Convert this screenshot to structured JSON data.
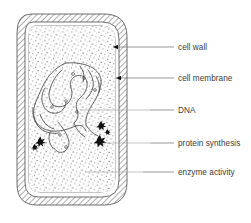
{
  "diagram": {
    "style": "black and white line drawing with hatched cell wall and stippled cytoplasm",
    "colors": {
      "line": "#4a4a4a",
      "text": "#3b3b3b",
      "leader": "#6e6e6e",
      "fill_dark": "#111111",
      "background": "#ffffff",
      "stipple": "#5a5a5a",
      "hatch": "#6a6a6a"
    },
    "labels": [
      {
        "id": "cell-wall",
        "text": "cell wall",
        "text_x": 178,
        "text_y": 50,
        "leader_x1": 158,
        "leader_x2": 174,
        "leader_y": 47,
        "pointer_x1": 113,
        "pointer_x2": 158,
        "pointer_y": 47,
        "has_arrow": true
      },
      {
        "id": "cell-membrane",
        "text": "cell membrane",
        "text_x": 178,
        "text_y": 81,
        "leader_x1": 158,
        "leader_x2": 174,
        "leader_y": 78,
        "pointer_x1": 116,
        "pointer_x2": 158,
        "pointer_y": 78,
        "has_arrow": true
      },
      {
        "id": "dna",
        "text": "DNA",
        "text_x": 178,
        "text_y": 113,
        "leader_x1": 150,
        "leader_x2": 174,
        "leader_y": 110,
        "pointer_x1": 80,
        "pointer_x2": 150,
        "pointer_y": 110,
        "has_arrow": false
      },
      {
        "id": "protein-synthesis",
        "text": "protein synthesis",
        "text_x": 178,
        "text_y": 146,
        "leader_x1": 150,
        "leader_x2": 174,
        "leader_y": 143,
        "pointer_x1": 104,
        "pointer_x2": 150,
        "pointer_y": 143,
        "has_arrow": false
      },
      {
        "id": "enzyme-activity",
        "text": "enzyme activity",
        "text_x": 178,
        "text_y": 175,
        "leader_x1": 143,
        "leader_x2": 174,
        "leader_y": 172,
        "pointer_x1": 85,
        "pointer_x2": 143,
        "pointer_y": 172,
        "has_arrow": false
      }
    ],
    "structures": [
      {
        "id": "cell-wall-band",
        "name": "cell wall",
        "description": "outer hatched band surrounding the cell"
      },
      {
        "id": "cell-membrane-band",
        "name": "cell membrane",
        "description": "thin line inside the cell wall"
      },
      {
        "id": "cytoplasm",
        "name": "cytoplasm",
        "description": "stippled interior region"
      },
      {
        "id": "nucleoid",
        "name": "DNA",
        "description": "tangled looped thread in the upper-left interior"
      },
      {
        "id": "ribosome-cluster-left",
        "name": "protein synthesis site",
        "description": "dark star-shaped blob lower left"
      },
      {
        "id": "ribosome-cluster-right",
        "name": "protein synthesis site",
        "description": "dark star-shaped blobs lower right"
      }
    ]
  }
}
